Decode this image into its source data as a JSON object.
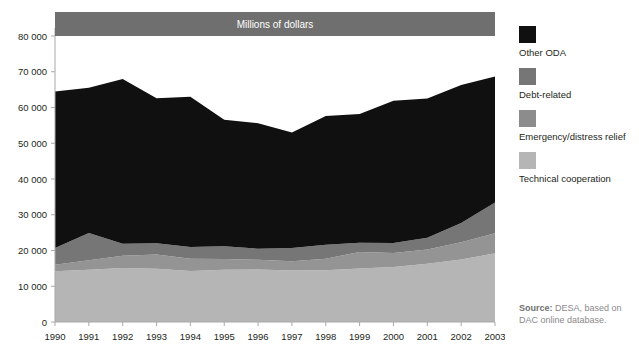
{
  "chart_data": {
    "type": "area",
    "title": "Millions of dollars",
    "xlabel": "",
    "ylabel": "",
    "ylim": [
      0,
      80000
    ],
    "yticks": [
      0,
      10000,
      20000,
      30000,
      40000,
      50000,
      60000,
      70000,
      80000
    ],
    "ytick_labels": [
      "0",
      "10 000",
      "20 000",
      "30 000",
      "40 000",
      "50 000",
      "60 000",
      "70 000",
      "80 000"
    ],
    "grid": false,
    "stacked": true,
    "legend_position": "right",
    "categories": [
      1990,
      1991,
      1992,
      1993,
      1994,
      1995,
      1996,
      1997,
      1998,
      1999,
      2000,
      2001,
      2002,
      2003
    ],
    "x": [
      "1990",
      "1991",
      "1992",
      "1993",
      "1994",
      "1995",
      "1996",
      "1997",
      "1998",
      "1999",
      "2000",
      "2001",
      "2002",
      "2003"
    ],
    "series": [
      {
        "name": "Technical cooperation",
        "color": "#b5b5b5",
        "values": [
          14200,
          14600,
          15100,
          14900,
          14300,
          14600,
          14700,
          14400,
          14500,
          15000,
          15400,
          16300,
          17500,
          19200
        ]
      },
      {
        "name": "Emergency/distress relief",
        "color": "#949494",
        "values": [
          1800,
          2700,
          3400,
          4000,
          3400,
          3000,
          2700,
          2600,
          3200,
          4600,
          3900,
          4000,
          4800,
          5600
        ]
      },
      {
        "name": "Debt-related",
        "color": "#767676",
        "values": [
          4700,
          7600,
          3400,
          3100,
          3300,
          3600,
          3100,
          3700,
          3900,
          2600,
          2800,
          3300,
          5400,
          8600
        ]
      },
      {
        "name": "Other ODA",
        "color": "#101010",
        "values": [
          43800,
          40600,
          46100,
          40600,
          42000,
          35400,
          35100,
          32300,
          36000,
          36000,
          39800,
          38900,
          38600,
          35300
        ]
      }
    ],
    "totals": [
      64500,
      65500,
      68000,
      62600,
      63000,
      56600,
      55600,
      53000,
      57600,
      58200,
      61900,
      62500,
      66300,
      68700
    ]
  },
  "legend": {
    "items": [
      {
        "label": "Other ODA",
        "color": "#101010"
      },
      {
        "label": "Debt-related",
        "color": "#767676"
      },
      {
        "label": "Emergency/distress relief",
        "color": "#8c8c8c"
      },
      {
        "label": "Technical cooperation",
        "color": "#b5b5b5"
      }
    ]
  },
  "source": {
    "title": "Source:",
    "text": "DESA, based on DAC online database."
  },
  "style": {
    "title_band_color": "#6f6f6f",
    "axis_color": "#a9a9a9",
    "plot_background": "#ffffff"
  }
}
